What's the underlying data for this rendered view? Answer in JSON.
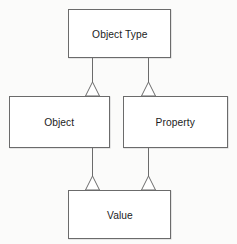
{
  "diagram": {
    "type": "uml-class-diagram",
    "title": "",
    "background_color": "#fbfbfa",
    "box_fill_color": "#ffffff",
    "box_border_color": "#6b6b6b",
    "text_color": "#1c1c1c",
    "nodes": [
      {
        "id": "object-type",
        "label": "Object Type"
      },
      {
        "id": "object",
        "label": "Object"
      },
      {
        "id": "property",
        "label": "Property"
      },
      {
        "id": "value",
        "label": "Value"
      }
    ],
    "edges": [
      {
        "id": "object-to-object-type",
        "from": "Object",
        "to": "Object Type",
        "relation": "generalization",
        "arrow": "hollow-triangle"
      },
      {
        "id": "property-to-object-type",
        "from": "Property",
        "to": "Object Type",
        "relation": "generalization",
        "arrow": "hollow-triangle"
      },
      {
        "id": "value-to-object",
        "from": "Value",
        "to": "Object",
        "relation": "generalization",
        "arrow": "hollow-triangle"
      },
      {
        "id": "value-to-property",
        "from": "Value",
        "to": "Property",
        "relation": "generalization",
        "arrow": "hollow-triangle"
      }
    ]
  }
}
